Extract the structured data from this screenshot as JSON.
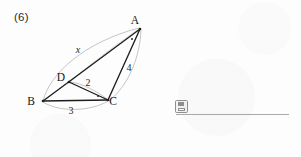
{
  "page": {
    "background_color": "#fdfdfd",
    "width": 301,
    "height": 157
  },
  "problem": {
    "number_label": "(6)"
  },
  "figure": {
    "type": "geometry-diagram",
    "stroke_color": "#1a1a1a",
    "arc_color": "#b9b9b9",
    "vertices": [
      {
        "name": "A",
        "label": "A",
        "x": 140,
        "y": 29,
        "label_x": 135,
        "label_y": 24
      },
      {
        "name": "B",
        "label": "B",
        "x": 43,
        "y": 101,
        "label_x": 31,
        "label_y": 105
      },
      {
        "name": "C",
        "label": "C",
        "x": 108,
        "y": 100,
        "label_x": 110,
        "label_y": 105
      },
      {
        "name": "D",
        "label": "D",
        "x": 69,
        "y": 82,
        "label_x": 58,
        "label_y": 81
      }
    ],
    "segments": [
      {
        "name": "BA",
        "from": "B",
        "to": "A"
      },
      {
        "name": "BC",
        "from": "B",
        "to": "C"
      },
      {
        "name": "DC",
        "from": "D",
        "to": "C"
      },
      {
        "name": "CA",
        "from": "C",
        "to": "A"
      }
    ],
    "measure_labels": [
      {
        "name": "x",
        "text": "x",
        "italic": true,
        "x": 78,
        "y": 53,
        "segment": "BA"
      },
      {
        "name": "four",
        "text": "4",
        "italic": false,
        "x": 129,
        "y": 71,
        "segment": "CA"
      },
      {
        "name": "two",
        "text": "2",
        "italic": false,
        "x": 88,
        "y": 86,
        "segment": "DC"
      },
      {
        "name": "three",
        "text": "3",
        "italic": false,
        "x": 71,
        "y": 114,
        "segment": "BC"
      }
    ],
    "angle_marks": [
      {
        "name": "angle-mark-a",
        "x": 132,
        "y": 39
      },
      {
        "name": "angle-mark-c",
        "x": 98,
        "y": 96
      }
    ],
    "arcs": [
      {
        "name": "arc-ba",
        "for_label": "x"
      },
      {
        "name": "arc-ac",
        "for_label": "4"
      },
      {
        "name": "arc-dc",
        "for_label": "2"
      },
      {
        "name": "arc-bc",
        "for_label": "3"
      }
    ]
  },
  "answer_area": {
    "icon_name": "save-icon",
    "rule_color": "#a9a9a9",
    "answer_value": ""
  }
}
